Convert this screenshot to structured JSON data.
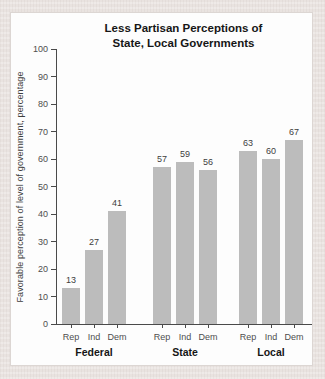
{
  "chart_data": {
    "type": "bar",
    "title_lines": [
      "Less Partisan Perceptions of",
      "State, Local Governments"
    ],
    "ylabel": "Favorable perception of level of government, percentage",
    "ylim": [
      0,
      100
    ],
    "ytick_step": 10,
    "yticks": [
      0,
      10,
      20,
      30,
      40,
      50,
      60,
      70,
      80,
      90,
      100
    ],
    "grid": false,
    "value_labels": true,
    "legend": "none",
    "bar_color": "#bcbcbc",
    "axis_color": "#4a4a4a",
    "categories": [
      "Rep",
      "Ind",
      "Dem"
    ],
    "groups": [
      {
        "label": "Federal",
        "categories": [
          "Rep",
          "Ind",
          "Dem"
        ],
        "values": [
          13,
          27,
          41
        ]
      },
      {
        "label": "State",
        "categories": [
          "Rep",
          "Ind",
          "Dem"
        ],
        "values": [
          57,
          59,
          56
        ]
      },
      {
        "label": "Local",
        "categories": [
          "Rep",
          "Ind",
          "Dem"
        ],
        "values": [
          63,
          60,
          67
        ]
      }
    ]
  },
  "colors": {
    "panel_background": "#fdfdfd",
    "page_background": "#e9e3e0",
    "panel_border": "#dcd6d3",
    "title_text": "#161616",
    "tick_text": "#4e4e4e"
  }
}
